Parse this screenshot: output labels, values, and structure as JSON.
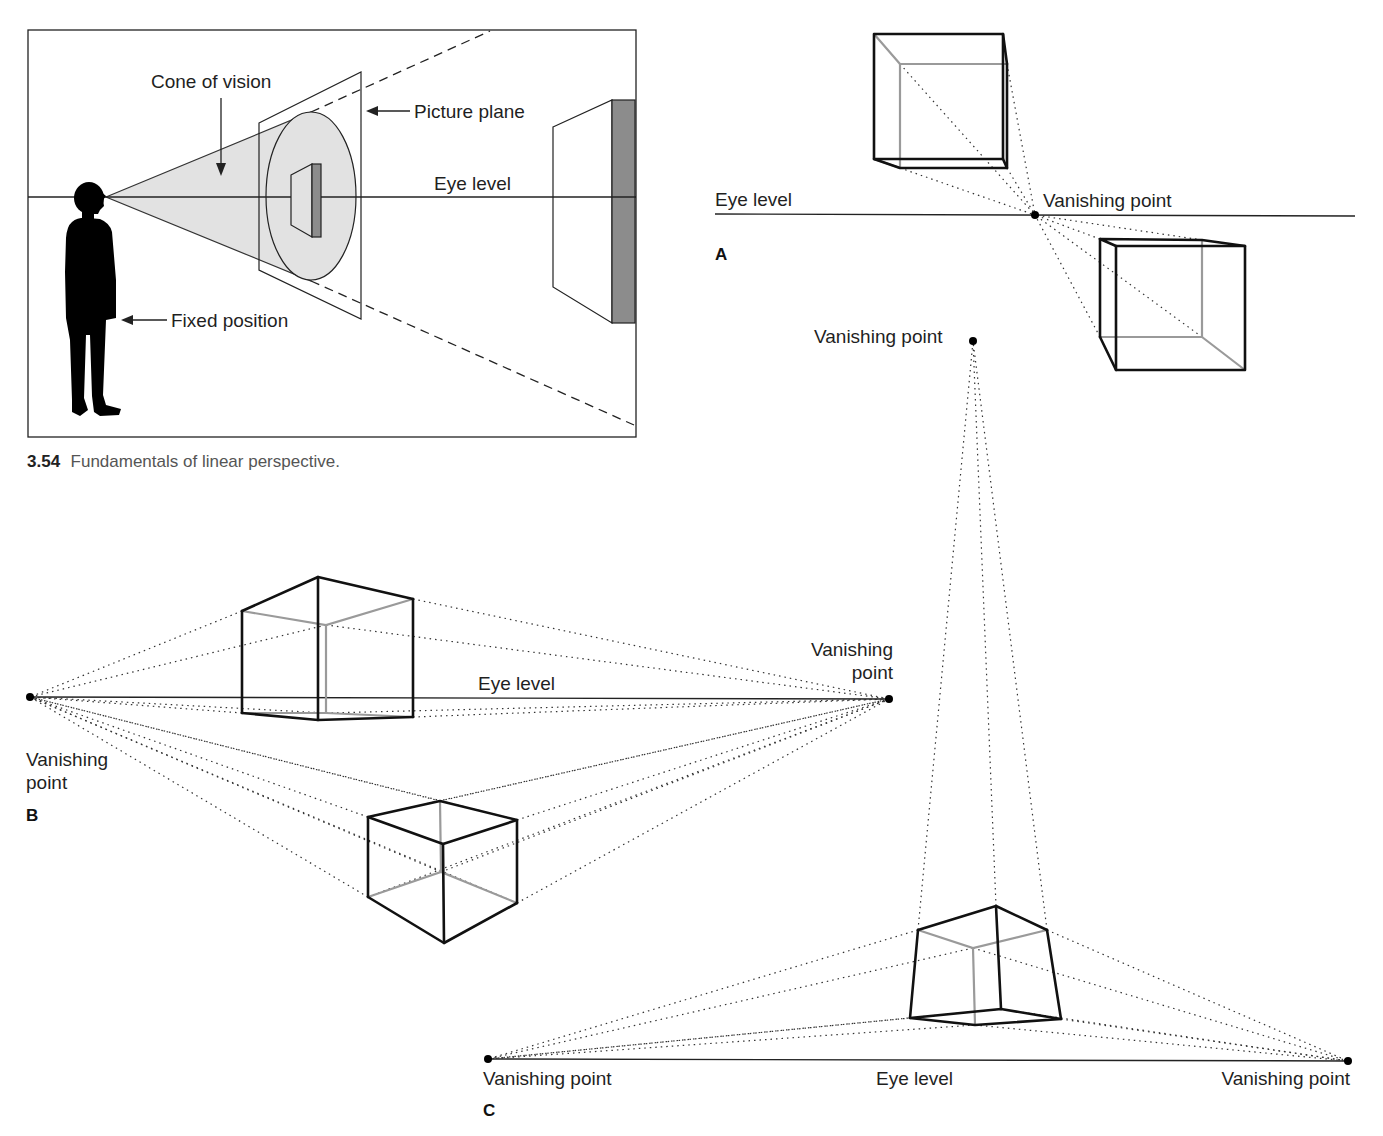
{
  "figure_354": {
    "caption_number": "3.54",
    "caption_text": "Fundamentals of linear perspective.",
    "labels": {
      "cone_of_vision": "Cone of vision",
      "picture_plane": "Picture plane",
      "eye_level": "Eye level",
      "fixed_position": "Fixed position"
    },
    "colors": {
      "cone_fill": "#e2e2e2",
      "shade_grey": "#8c8c8c"
    }
  },
  "panel_a": {
    "letter": "A",
    "eye_level_label": "Eye level",
    "vanishing_point_label": "Vanishing point",
    "type": "one-point perspective"
  },
  "panel_b": {
    "letter": "B",
    "eye_level_label": "Eye level",
    "left_vp_label_line1": "Vanishing",
    "left_vp_label_line2": "point",
    "right_vp_label_line1": "Vanishing",
    "right_vp_label_line2": "point",
    "type": "two-point perspective"
  },
  "panel_c": {
    "letter": "C",
    "eye_level_label": "Eye level",
    "top_vp_label": "Vanishing point",
    "left_vp_label": "Vanishing point",
    "right_vp_label": "Vanishing point",
    "type": "three-point perspective"
  }
}
